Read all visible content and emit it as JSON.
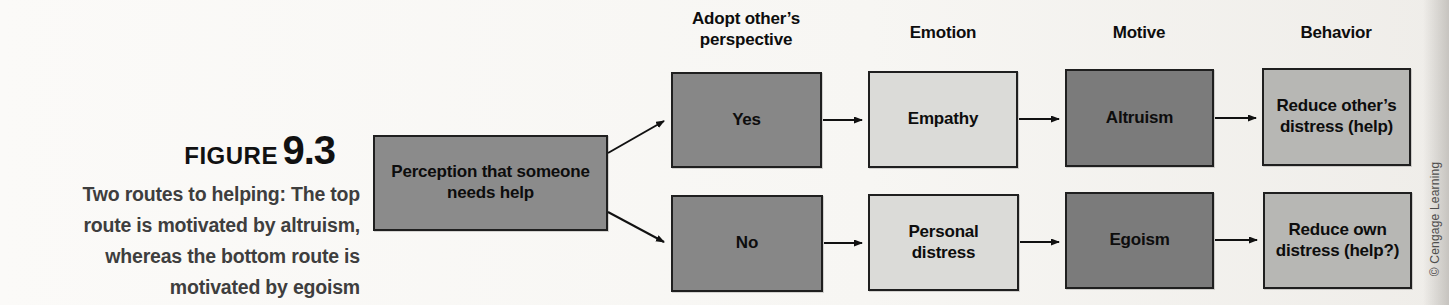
{
  "figure": {
    "label": "FIGURE",
    "number": "9.3",
    "caption_lines": [
      "Two routes to helping: The top",
      "route is motivated by altruism,",
      "whereas the bottom route is",
      "motivated by egoism"
    ]
  },
  "headers": [
    {
      "label": "Adopt other’s perspective"
    },
    {
      "label": "Emotion"
    },
    {
      "label": "Motive"
    },
    {
      "label": "Behavior"
    }
  ],
  "nodes": {
    "perception": {
      "label": "Perception that someone needs help"
    },
    "yes": {
      "label": "Yes"
    },
    "no": {
      "label": "No"
    },
    "empathy": {
      "label": "Empathy"
    },
    "personal_distress": {
      "label": "Personal distress"
    },
    "altruism": {
      "label": "Altruism"
    },
    "egoism": {
      "label": "Egoism"
    },
    "reduce_others": {
      "label": "Reduce other’s distress (help)"
    },
    "reduce_own": {
      "label": "Reduce own distress (help?)"
    }
  },
  "credit": "© Cengage Learning",
  "colors": {
    "perception_fill": "#8b8b8b",
    "decision_fill": "#878787",
    "emotion_fill": "#dbdbd8",
    "motive_fill": "#7b7b7b",
    "behavior_fill": "#b7b7b4",
    "border": "#1f1f1f",
    "arrow": "#111111",
    "background": "#f7f6f3"
  }
}
